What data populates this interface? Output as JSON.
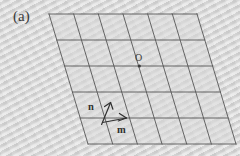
{
  "figure": {
    "panel_label": "(a)",
    "background_color": "#dcdcdc",
    "line_color": "#555555",
    "label_color": "#3a3a3a"
  },
  "lattice": {
    "shape": "parallelogram",
    "columns": 6,
    "rows": 5,
    "vertices": {
      "top_left": [
        49,
        14
      ],
      "top_right": [
        197,
        14
      ],
      "bottom_right": [
        236,
        144
      ],
      "bottom_left": [
        88,
        144
      ]
    },
    "origin": {
      "label": "O",
      "point": [
        139,
        66
      ]
    },
    "basis_vectors": [
      {
        "label": "m",
        "direction": "right-horizontal",
        "start": [
          104,
          122
        ],
        "end": [
          127,
          118
        ]
      },
      {
        "label": "n",
        "direction": "up-slanted",
        "start": [
          101,
          124
        ],
        "end": [
          111,
          102
        ]
      }
    ]
  },
  "icons": {
    "arrow_m": "arrow-right-icon",
    "arrow_n": "arrow-up-icon",
    "origin_dot": "dot-icon"
  }
}
